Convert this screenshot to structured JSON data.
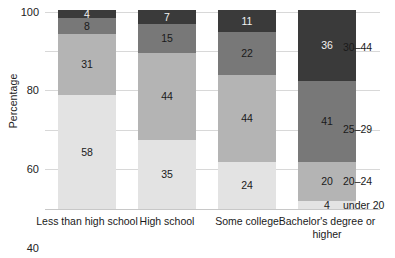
{
  "chart_data": {
    "type": "bar",
    "subtype": "stacked-100-percent",
    "title": "",
    "xlabel": "",
    "ylabel": "Percentage",
    "ylim": [
      0,
      100
    ],
    "yticks": [
      0,
      20,
      40,
      60,
      80,
      100
    ],
    "grid": true,
    "legend_position": "right-of-plot-inline",
    "categories": [
      "Less than high school",
      "High school",
      "Some college",
      "Bachelor's degree or higher"
    ],
    "series": [
      {
        "name": "under 20",
        "color": "#e3e3e3",
        "values": [
          58,
          35,
          24,
          4
        ]
      },
      {
        "name": "20–24",
        "color": "#b4b4b4",
        "values": [
          31,
          44,
          44,
          20
        ]
      },
      {
        "name": "25–29",
        "color": "#787878",
        "values": [
          8,
          15,
          22,
          41
        ]
      },
      {
        "name": "30–44",
        "color": "#3a3a3a",
        "values": [
          4,
          7,
          11,
          36
        ]
      }
    ],
    "axis": {
      "y_title": "Percentage",
      "y_tick_labels": [
        "0",
        "20",
        "40",
        "60",
        "80",
        "100"
      ]
    },
    "legend_entries": [
      {
        "label": "30–44",
        "anchor_value": 82
      },
      {
        "label": "25–29",
        "anchor_value": 40.5
      },
      {
        "label": "20–24",
        "anchor_value": 14
      },
      {
        "label": "under 20",
        "anchor_value": 2
      }
    ],
    "colors": {
      "gridline": "#d8d8d8",
      "baseline": "#c8c8c8",
      "text": "#1a1a1a",
      "background": "#ffffff"
    }
  }
}
